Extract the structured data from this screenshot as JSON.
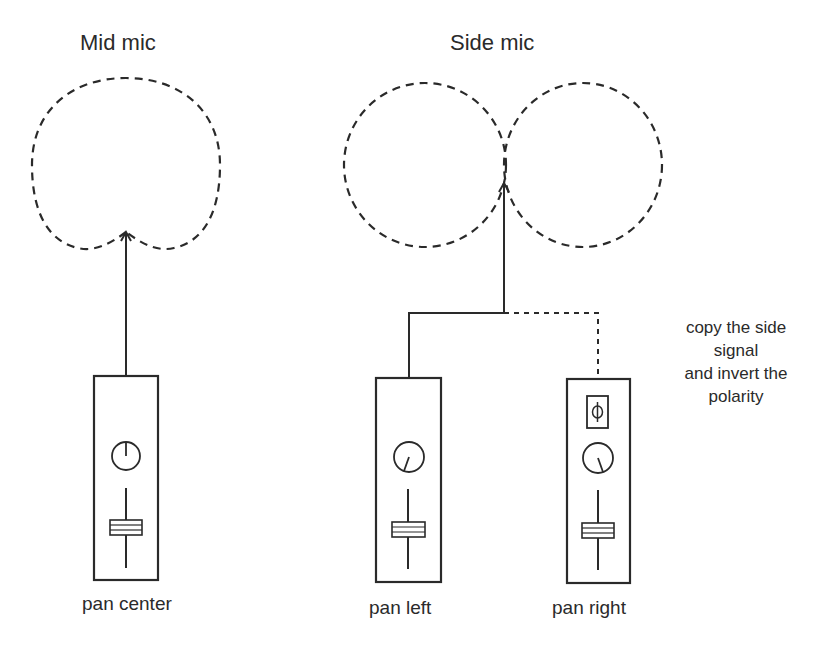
{
  "diagram": {
    "colors": {
      "ink": "#2a2a2a",
      "background": "#ffffff"
    }
  },
  "mid_mic": {
    "label": "Mid mic",
    "pattern": "cardioid",
    "channel": {
      "caption": "pan center",
      "pan_knob": "center",
      "polarity_invert": false
    }
  },
  "side_mic": {
    "label": "Side mic",
    "pattern": "figure-8",
    "channels": [
      {
        "caption": "pan left",
        "pan_knob": "left",
        "polarity_invert": false,
        "connection": "solid"
      },
      {
        "caption": "pan right",
        "pan_knob": "right",
        "polarity_invert": true,
        "polarity_symbol": "ϕ",
        "connection": "dashed"
      }
    ]
  },
  "annotation": {
    "lines": [
      "copy the side",
      "signal",
      "and invert the",
      "polarity"
    ]
  }
}
